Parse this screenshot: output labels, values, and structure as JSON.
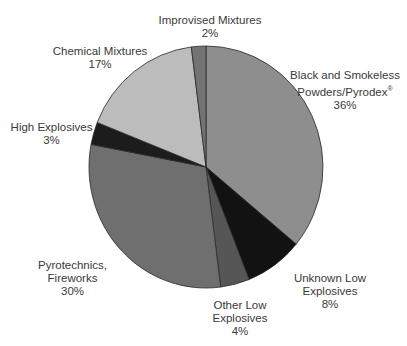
{
  "chart_data": {
    "type": "pie",
    "title": "",
    "start_angle_deg": 0,
    "direction": "clockwise",
    "slices": [
      {
        "label": "Black and Smokeless Powders/Pyrodex®",
        "value": 36,
        "pct_label": "36%",
        "color": "#8e8e8e"
      },
      {
        "label": "Unknown Low Explosives",
        "value": 8,
        "pct_label": "8%",
        "color": "#121212"
      },
      {
        "label": "Other Low Explosives",
        "value": 4,
        "pct_label": "4%",
        "color": "#565656"
      },
      {
        "label": "Pyrotechnics, Fireworks",
        "value": 30,
        "pct_label": "30%",
        "color": "#6f6f6f"
      },
      {
        "label": "High Explosives",
        "value": 3,
        "pct_label": "3%",
        "color": "#1c1c1c"
      },
      {
        "label": "Chemical Mixtures",
        "value": 17,
        "pct_label": "17%",
        "color": "#bcbcbc"
      },
      {
        "label": "Improvised Mixtures",
        "value": 2,
        "pct_label": "2%",
        "color": "#737373"
      }
    ]
  },
  "labels": {
    "black_powder": {
      "line1": "Black and Smokeless",
      "line2": "Powders/Pyrodex",
      "reg": "®",
      "pct": "36%"
    },
    "unknown_low": {
      "line1": "Unknown Low",
      "line2": "Explosives",
      "pct": "8%"
    },
    "other_low": {
      "line1": "Other Low",
      "line2": "Explosives",
      "pct": "4%"
    },
    "pyrotechnics": {
      "line1": "Pyrotechnics,",
      "line2": "Fireworks",
      "pct": "30%"
    },
    "high_explosives": {
      "line1": "High Explosives",
      "pct": "3%"
    },
    "chemical": {
      "line1": "Chemical Mixtures",
      "pct": "17%"
    },
    "improvised": {
      "line1": "Improvised Mixtures",
      "pct": "2%"
    }
  }
}
